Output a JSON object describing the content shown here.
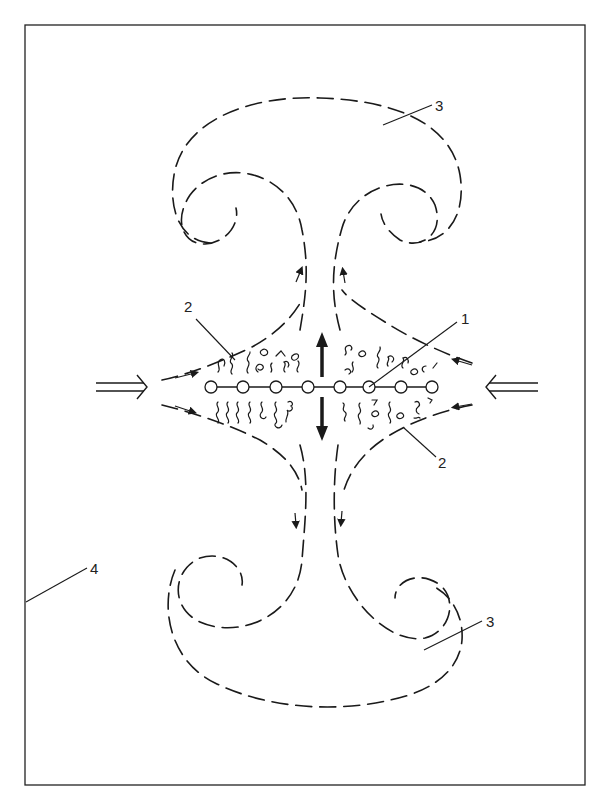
{
  "figure": {
    "colors": {
      "stroke": "#1a1a1a",
      "background": "#ffffff"
    },
    "labels": [
      {
        "id": "1",
        "text": "1",
        "x": 466,
        "y": 324
      },
      {
        "id": "2a",
        "text": "2",
        "x": 185,
        "y": 312
      },
      {
        "id": "2b",
        "text": "2",
        "x": 439,
        "y": 468
      },
      {
        "id": "3a",
        "text": "3",
        "x": 437,
        "y": 111
      },
      {
        "id": "3b",
        "text": "3",
        "x": 490,
        "y": 627
      },
      {
        "id": "4",
        "text": "4",
        "x": 93,
        "y": 574
      }
    ],
    "nodes": {
      "count": 8,
      "y": 387,
      "x": [
        211,
        243,
        276,
        308,
        340,
        369,
        401,
        432
      ]
    },
    "arrows": {
      "left_input": "double-arrow-right",
      "right_input": "double-arrow-left",
      "center_up": "arrow-up",
      "center_down": "arrow-down"
    }
  }
}
